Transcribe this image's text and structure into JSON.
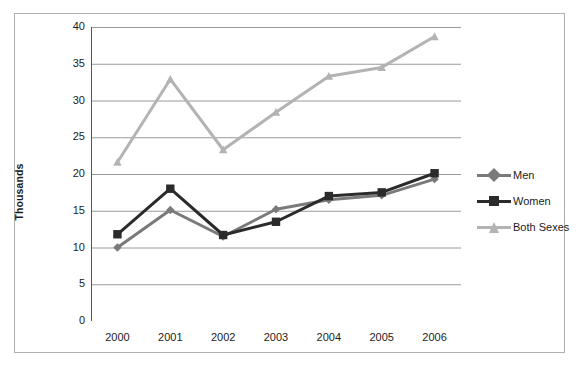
{
  "chart_data": {
    "type": "line",
    "title": "",
    "xlabel": "",
    "ylabel": "Thousands",
    "categories": [
      "2000",
      "2001",
      "2002",
      "2003",
      "2004",
      "2005",
      "2006"
    ],
    "x": [
      2000,
      2001,
      2002,
      2003,
      2004,
      2005,
      2006
    ],
    "ylim": [
      0,
      40
    ],
    "ytick_labels": [
      "0",
      "5",
      "10",
      "15",
      "20",
      "25",
      "30",
      "35",
      "40"
    ],
    "ytick_values": [
      0,
      5,
      10,
      15,
      20,
      25,
      30,
      35,
      40
    ],
    "grid": "horizontal",
    "legend_position": "right",
    "series": [
      {
        "name": "Men",
        "values": [
          10.0,
          15.1,
          11.5,
          15.2,
          16.5,
          17.1,
          19.3
        ],
        "color": "#7a7a7a",
        "marker": "diamond"
      },
      {
        "name": "Women",
        "values": [
          11.8,
          18.0,
          11.7,
          13.5,
          17.0,
          17.5,
          20.1
        ],
        "color": "#2b2b2b",
        "marker": "square"
      },
      {
        "name": "Both Sexes",
        "values": [
          21.6,
          32.9,
          23.3,
          28.4,
          33.3,
          34.5,
          38.7
        ],
        "color": "#b3b3b3",
        "marker": "triangle"
      }
    ]
  },
  "axis": {
    "y_title": "Thousands"
  },
  "legend": {
    "items": [
      {
        "label": "Men"
      },
      {
        "label": "Women"
      },
      {
        "label": "Both Sexes"
      }
    ]
  },
  "colors": {
    "men": "#7a7a7a",
    "women": "#2b2b2b",
    "both_sexes": "#b3b3b3",
    "grid": "#9a9a9a",
    "axis": "#555555",
    "border": "#b0b0b0"
  }
}
